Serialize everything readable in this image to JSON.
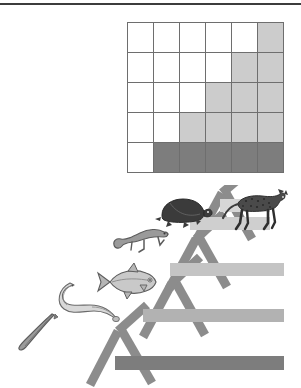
{
  "figure": {
    "kind": "biology-figure",
    "background": "#ffffff",
    "rule_color": "#3c3c3c"
  },
  "palette": {
    "absent": "#ffffff",
    "derived_light": "#cccccc",
    "derived_dark": "#7d7d7d",
    "grid_line": "#6e6e6e",
    "branch": "#8c8c8c",
    "bar_1": "#7d7d7d",
    "bar_2": "#b2b2b2",
    "bar_3": "#c4c4c4",
    "bar_4": "#cfcfcf",
    "bar_5": "#d6d6d6"
  },
  "chart_data": {
    "type": "heatmap",
    "xlabel": "",
    "ylabel": "",
    "grid": true,
    "legend": "none",
    "columns": [
      "taxon-1",
      "taxon-2",
      "taxon-3",
      "taxon-4",
      "taxon-5",
      "taxon-6"
    ],
    "rows": [
      "character-5",
      "character-4",
      "character-3",
      "character-2",
      "character-1"
    ],
    "value_key": {
      "0": "absent (white)",
      "1": "present-light (light gray)",
      "2": "present-dark (dark gray)"
    },
    "values": [
      [
        0,
        0,
        0,
        0,
        0,
        1
      ],
      [
        0,
        0,
        0,
        0,
        1,
        1
      ],
      [
        0,
        0,
        0,
        1,
        1,
        1
      ],
      [
        0,
        0,
        1,
        1,
        1,
        1
      ],
      [
        0,
        2,
        2,
        2,
        2,
        2
      ]
    ]
  },
  "matrix": {
    "name": "character-matrix",
    "rows": 5,
    "cols": 6
  },
  "cladogram": {
    "name": "vertebrate-cladogram",
    "taxa": [
      {
        "id": "lancelet",
        "label": "lancelet",
        "icon": "lancelet-icon"
      },
      {
        "id": "lamprey",
        "label": "lamprey",
        "icon": "lamprey-icon"
      },
      {
        "id": "fish",
        "label": "ray-finned-fish",
        "icon": "fish-icon"
      },
      {
        "id": "salamander",
        "label": "salamander",
        "icon": "salamander-icon"
      },
      {
        "id": "turtle",
        "label": "turtle",
        "icon": "turtle-icon"
      },
      {
        "id": "leopard",
        "label": "leopard",
        "icon": "leopard-icon"
      }
    ],
    "derived_character_bars": [
      {
        "id": "bar-1",
        "shade": "#7d7d7d"
      },
      {
        "id": "bar-2",
        "shade": "#b2b2b2"
      },
      {
        "id": "bar-3",
        "shade": "#c4c4c4"
      },
      {
        "id": "bar-4",
        "shade": "#cfcfcf"
      },
      {
        "id": "bar-5",
        "shade": "#d6d6d6"
      }
    ]
  }
}
